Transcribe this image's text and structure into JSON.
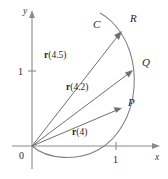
{
  "figure": {
    "type": "vector-valued-function-diagram",
    "background_color": "#ffffff",
    "ink_color": "#7e7e7e",
    "text_color": "#1f1f1f"
  },
  "axes": {
    "x_axis_label": "x",
    "y_axis_label": "y",
    "origin_label": "0",
    "x_ticks": [
      {
        "label": "1"
      }
    ],
    "y_ticks": [
      {
        "label": "1"
      }
    ]
  },
  "curve": {
    "label": "C"
  },
  "points": [
    {
      "name": "point-p",
      "label": "P"
    },
    {
      "name": "point-q",
      "label": "Q"
    },
    {
      "name": "point-r",
      "label": "R"
    }
  ],
  "vectors": [
    {
      "name": "vector-r4",
      "bold": "r",
      "arg": "(4)",
      "label": "r(4)"
    },
    {
      "name": "vector-r42",
      "bold": "r",
      "arg": "(4.2)",
      "label": "r(4.2)"
    },
    {
      "name": "vector-r45",
      "bold": "r",
      "arg": "(4.5)",
      "label": "r(4.5)"
    }
  ]
}
